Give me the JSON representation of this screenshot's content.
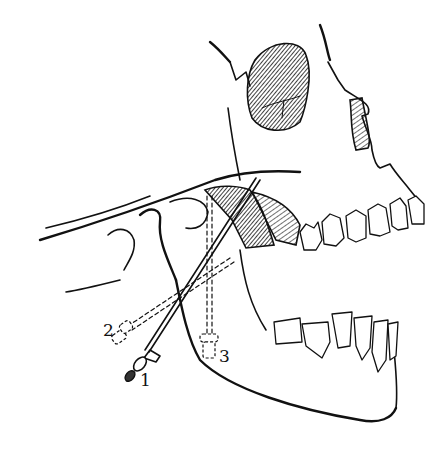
{
  "figure": {
    "colors": {
      "ink": "#111111",
      "paper": "#ffffff"
    },
    "labels": [
      {
        "id": "needle-1",
        "text": "1",
        "x": 140,
        "y": 372
      },
      {
        "id": "needle-2",
        "text": "2",
        "x": 103,
        "y": 322
      },
      {
        "id": "needle-3",
        "text": "3",
        "x": 219,
        "y": 348
      }
    ]
  }
}
